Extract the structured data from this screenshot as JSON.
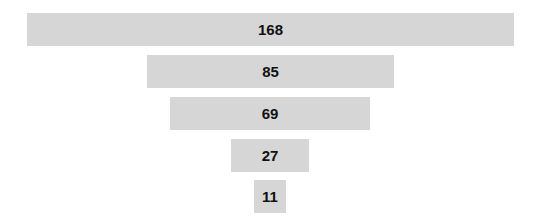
{
  "chart_data": {
    "type": "funnel",
    "title": "",
    "categories": [
      "",
      "",
      "",
      "",
      ""
    ],
    "values": [
      168,
      85,
      69,
      27,
      11
    ],
    "labels": [
      "168",
      "85",
      "69",
      "27",
      "11"
    ],
    "legend": null,
    "grid": false,
    "bar_color": "#d6d6d6",
    "label_color": "#111111"
  },
  "layout": {
    "center_x": 270,
    "px_per_unit": 2.9,
    "tops": [
      13,
      55,
      97,
      139,
      180
    ],
    "bar_height": 33
  }
}
